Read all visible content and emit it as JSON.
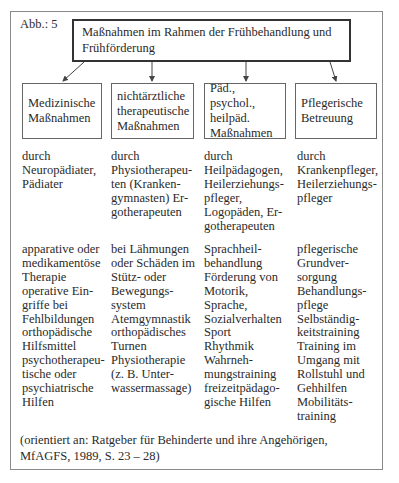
{
  "figure_label": "Abb.: 5",
  "title": "Maßnahmen im Rahmen der Frühbehandlung und Frühförderung",
  "columns": [
    {
      "heading": "Medizinische Maßnahmen",
      "by": "durch\nNeuropädiater,\nPädiater",
      "measures": "apparative oder\nmedikamentöse\nTherapie\noperative Ein-\ngriffe bei\nFehlbildungen\northopädische\nHilfsmittel\npsychotherapeu-\ntische oder\npsychiatrische\nHilfen"
    },
    {
      "heading": "nichtärztliche therapeutische Maßnahmen",
      "by": "durch\nPhysiotherapeu-\nten (Kranken-\ngymnasten) Er-\ngotherapeuten",
      "measures": "bei Lähmungen\noder Schäden im\nStütz- oder\nBewegungs-\nsystem\nAtemgymnastik\northopädisches\nTurnen\nPhysiotherapie\n(z. B. Unter-\nwassermassage)"
    },
    {
      "heading": "Päd., psychol., heilpäd. Maßnahmen",
      "by": "durch\nHeilpädagogen,\nHeilerziehungs-\npfleger,\nLogopäden, Er-\ngotherapeuten",
      "measures": "Sprachheil-\nbehandlung\nFörderung von\nMotorik,\nSprache,\nSozialverhalten\nSport\nRhythmik\nWahrneh-\nmungstraining\nfreizeitpädago-\ngische Hilfen"
    },
    {
      "heading": "Pflegerische Betreuung",
      "by": "durch\nKrankenpfleger,\nHeilerziehungs-\npfleger",
      "measures": "pflegerische\nGrundver-\nsorgung\nBehandlungs-\npflege\nSelbständig-\nkeitstraining\nTraining im\nUmgang mit\nRollstuhl und\nGehhilfen\nMobilitäts-\ntraining"
    }
  ],
  "source": "(orientiert an: Ratgeber für Behinderte und ihre Angehörigen, MfAGFS, 1989, S. 23 – 28)"
}
